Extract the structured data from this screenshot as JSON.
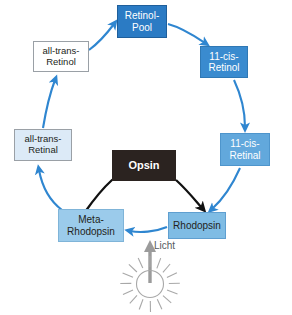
{
  "diagram": {
    "nodes": [
      {
        "id": "retinol-pool",
        "label": "Retinol-\nPool",
        "fill": "#2b7bc4",
        "border": "#1f5f9b",
        "text_color": "#ffffff"
      },
      {
        "id": "all-trans-retinol",
        "label": "all-trans-\nRetinol",
        "fill": "#ffffff",
        "border": "#9aa0a6",
        "text_color": "#231f20"
      },
      {
        "id": "11-cis-retinol",
        "label": "11-cis-\nRetinol",
        "fill": "#3a8bcf",
        "border": "#2f78b4",
        "text_color": "#ffffff"
      },
      {
        "id": "all-trans-retinal",
        "label": "all-trans-\nRetinal",
        "fill": "#dceaf7",
        "border": "#9aa0a6",
        "text_color": "#231f20"
      },
      {
        "id": "11-cis-retinal",
        "label": "11-cis-\nRetinal",
        "fill": "#62a8dc",
        "border": "#4e95cc",
        "text_color": "#ffffff"
      },
      {
        "id": "opsin",
        "label": "Opsin",
        "fill": "#2b2320",
        "border": "#2b2320",
        "text_color": "#ffffff"
      },
      {
        "id": "meta-rhodopsin",
        "label": "Meta-\nRhodopsin",
        "fill": "#9bcbeb",
        "border": "#7fb4d8",
        "text_color": "#231f20"
      },
      {
        "id": "rhodopsin",
        "label": "Rhodopsin",
        "fill": "#7fbce4",
        "border": "#5f9fd0",
        "text_color": "#231f20"
      }
    ],
    "light": {
      "label": "Licht",
      "icon": "sun-icon",
      "arrow_color": "#9b9b9b",
      "ray_count": 16
    },
    "arrows": {
      "cycle_color": "#2f86d0",
      "opsin_color": "#111111",
      "flow": [
        {
          "from": "all-trans-retinol",
          "to": "retinol-pool"
        },
        {
          "from": "retinol-pool",
          "to": "11-cis-retinol"
        },
        {
          "from": "11-cis-retinol",
          "to": "11-cis-retinal"
        },
        {
          "from": "11-cis-retinal",
          "to": "rhodopsin"
        },
        {
          "from": "rhodopsin",
          "to": "meta-rhodopsin"
        },
        {
          "from": "meta-rhodopsin",
          "to": "all-trans-retinal"
        },
        {
          "from": "all-trans-retinal",
          "to": "all-trans-retinol"
        },
        {
          "from": "meta-rhodopsin",
          "to": "opsin"
        },
        {
          "from": "opsin",
          "to": "rhodopsin"
        },
        {
          "from": "light",
          "to": "rhodopsin"
        }
      ]
    }
  }
}
